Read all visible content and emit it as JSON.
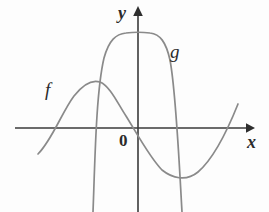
{
  "figure": {
    "background_color": "#fdfdfd",
    "axis_color": "#3a3a3a",
    "curve_color": "#8a8a8a",
    "label_color": "#2b2b2b"
  },
  "axes": {
    "x_label": "x",
    "y_label": "y",
    "origin_label": "0",
    "x_axis_icon": "arrow-right-icon",
    "y_axis_icon": "arrow-up-icon",
    "x_axis_y_pixel": 128,
    "y_axis_x_pixel": 138,
    "x_axis_start_pixel": 15,
    "x_axis_end_pixel": 253,
    "y_axis_top_pixel": 8,
    "y_axis_bottom_pixel": 212,
    "grid": false,
    "tick_labels": []
  },
  "curves": {
    "f": {
      "label": "f",
      "color": "#8a8a8a",
      "shape": "cubic-like S curve: rises from lower left, local maximum left of the y-axis, decreasing through the origin, local minimum right of the y-axis, then rising again",
      "x_intercepts_pixel": [
        48,
        139,
        228
      ],
      "local_max_pixel": [
        98,
        82
      ],
      "local_min_pixel": [
        183,
        178
      ],
      "path": "M 38,154 C 52,140 62,112 74,96 C 85,82 94,80 100,82 C 110,86 118,104 126,116 C 136,132 150,158 162,170 C 172,178 186,182 198,172 C 212,160 226,134 238,104"
    },
    "g": {
      "label": "g",
      "color": "#8a8a8a",
      "shape": "tall flat-topped bell / plateau hump straddling the y-axis, with steep nearly vertical sides descending off the bottom of the frame",
      "x_intercepts_pixel": [
        99,
        176
      ],
      "plateau_top_pixel_y": 35,
      "plateau_x_range_pixel": [
        120,
        156
      ],
      "left_leg_end_pixel": [
        93,
        212
      ],
      "right_leg_end_pixel": [
        182,
        212
      ],
      "path": "M 93,212 C 95,160 96,92 104,58 C 109,40 116,34 126,33 C 134,32 142,32 150,33 C 160,34 166,42 170,60 C 176,92 179,160 182,212"
    }
  },
  "labels": {
    "f": "f",
    "g": "g",
    "x": "x",
    "y": "y",
    "origin": "0"
  }
}
